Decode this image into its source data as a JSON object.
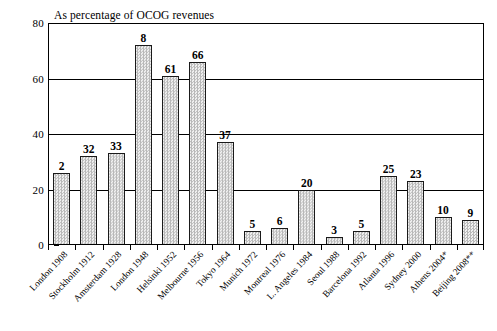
{
  "chart_data": {
    "type": "bar",
    "title": "As percentage of OCOG revenues",
    "xlabel": "",
    "ylabel": "",
    "ylim": [
      0,
      80
    ],
    "yticks": [
      0,
      20,
      40,
      60,
      80
    ],
    "grid": true,
    "legend": false,
    "categories": [
      "London 1908",
      "Stockholm 1912",
      "Amsterdam 1928",
      "London 1948",
      "Helsinki 1952",
      "Melbourne 1956",
      "Tokyo 1964",
      "Munich 1972",
      "Montreal 1976",
      "L. Angeles 1984",
      "Seoul 1988",
      "Barcelona 1992",
      "Atlanta 1996",
      "Sydney 2000",
      "Athens 2004*",
      "Beijing 2008**"
    ],
    "values": [
      26,
      32,
      33,
      72,
      61,
      66,
      37,
      5,
      6,
      20,
      3,
      5,
      25,
      23,
      10,
      9
    ],
    "data_labels": [
      "2",
      "32",
      "33",
      "8",
      "61",
      "66",
      "37",
      "5",
      "6",
      "20",
      "3",
      "5",
      "25",
      "23",
      "10",
      "9"
    ]
  },
  "bars": [
    {
      "label": "London 1908",
      "value": 26,
      "data_label": "2"
    },
    {
      "label": "Stockholm 1912",
      "value": 32,
      "data_label": "32"
    },
    {
      "label": "Amsterdam 1928",
      "value": 33,
      "data_label": "33"
    },
    {
      "label": "London 1948",
      "value": 72,
      "data_label": "8"
    },
    {
      "label": "Helsinki 1952",
      "value": 61,
      "data_label": "61"
    },
    {
      "label": "Melbourne 1956",
      "value": 66,
      "data_label": "66"
    },
    {
      "label": "Tokyo 1964",
      "value": 37,
      "data_label": "37"
    },
    {
      "label": "Munich 1972",
      "value": 5,
      "data_label": "5"
    },
    {
      "label": "Montreal 1976",
      "value": 6,
      "data_label": "6"
    },
    {
      "label": "L. Angeles 1984",
      "value": 20,
      "data_label": "20"
    },
    {
      "label": "Seoul 1988",
      "value": 3,
      "data_label": "3"
    },
    {
      "label": "Barcelona 1992",
      "value": 5,
      "data_label": "5"
    },
    {
      "label": "Atlanta 1996",
      "value": 25,
      "data_label": "25"
    },
    {
      "label": "Sydney 2000",
      "value": 23,
      "data_label": "23"
    },
    {
      "label": "Athens 2004*",
      "value": 10,
      "data_label": "10"
    },
    {
      "label": "Beijing 2008**",
      "value": 9,
      "data_label": "9"
    }
  ],
  "yticks": [
    {
      "label": "80",
      "value": 80
    },
    {
      "label": "60",
      "value": 60
    },
    {
      "label": "40",
      "value": 40
    },
    {
      "label": "20",
      "value": 20
    },
    {
      "label": "0",
      "value": 0
    }
  ],
  "colors": {
    "axis": "#000000",
    "bar_outline": "#1a1a1a",
    "bar_fill": "#e2e2e2",
    "background": "#ffffff"
  }
}
